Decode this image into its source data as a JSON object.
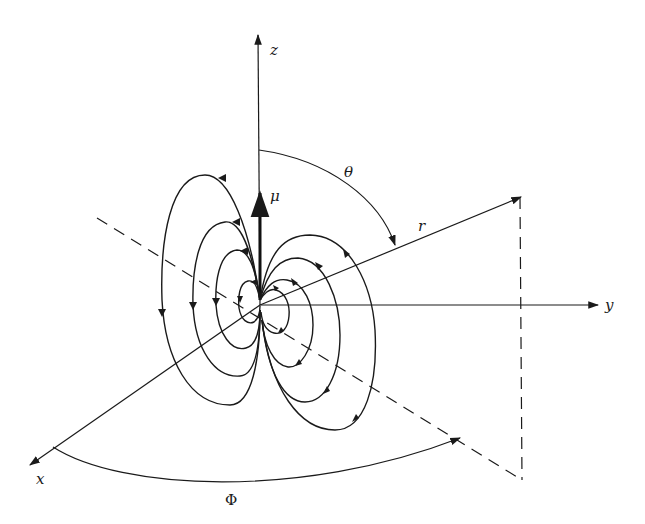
{
  "figure": {
    "labels": {
      "z_axis": "z",
      "y_axis": "y",
      "x_axis": "x",
      "polar_angle": "θ",
      "radius": "r",
      "azimuth": "Φ",
      "dipole_moment": "μ"
    },
    "colors": {
      "line": "#1a1a1a",
      "background": "#ffffff"
    },
    "elements": {
      "field_line_loops_per_side": 4,
      "dipole_orientation": "+z",
      "dashed_lines": [
        "projection of r onto xy-plane",
        "vertical drop from tip of r"
      ]
    }
  }
}
